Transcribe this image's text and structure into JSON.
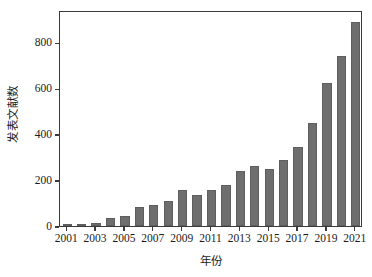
{
  "chart_data": {
    "type": "bar",
    "title": "",
    "xlabel": "年份",
    "ylabel": "发表文献数",
    "categories": [
      "2001",
      "2002",
      "2003",
      "2004",
      "2005",
      "2006",
      "2007",
      "2008",
      "2009",
      "2010",
      "2011",
      "2012",
      "2013",
      "2014",
      "2015",
      "2016",
      "2017",
      "2018",
      "2019",
      "2020",
      "2021"
    ],
    "values": [
      8,
      6,
      12,
      35,
      45,
      84,
      93,
      110,
      158,
      136,
      155,
      178,
      240,
      261,
      250,
      286,
      346,
      450,
      624,
      739,
      890
    ],
    "xtick_labels": [
      "2001",
      "2003",
      "2005",
      "2007",
      "2009",
      "2011",
      "2013",
      "2015",
      "2017",
      "2019",
      "2021"
    ],
    "ytick_labels": [
      "0",
      "200",
      "400",
      "600",
      "800"
    ],
    "ytick_values": [
      0,
      200,
      400,
      600,
      800
    ],
    "ylim": [
      0,
      940
    ],
    "grid": false,
    "legend": "none",
    "bar_color": "#6e6e6e",
    "axis_color": "#3a3a3a",
    "background_color": "#ffffff"
  }
}
